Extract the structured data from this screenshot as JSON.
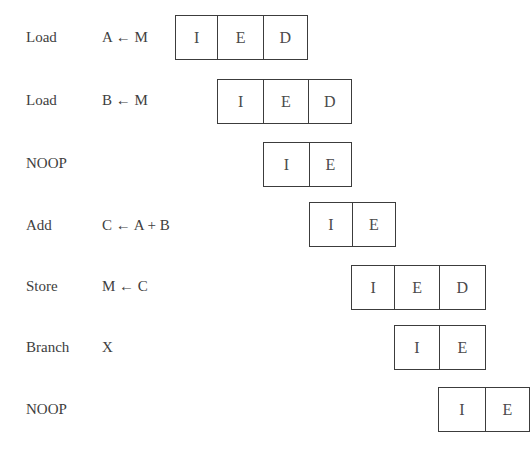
{
  "diagram": {
    "type": "pipeline-timing",
    "rows": [
      {
        "op": "Load",
        "arg": "A ← M",
        "stages": [
          "I",
          "E",
          "D"
        ],
        "start_slot": 0
      },
      {
        "op": "Load",
        "arg": "B ← M",
        "stages": [
          "I",
          "E",
          "D"
        ],
        "start_slot": 1
      },
      {
        "op": "NOOP",
        "arg": "",
        "stages": [
          "I",
          "E"
        ],
        "start_slot": 2
      },
      {
        "op": "Add",
        "arg": "C ← A + B",
        "stages": [
          "I",
          "E"
        ],
        "start_slot": 3
      },
      {
        "op": "Store",
        "arg": "M ← C",
        "stages": [
          "I",
          "E",
          "D"
        ],
        "start_slot": 4
      },
      {
        "op": "Branch",
        "arg": "X",
        "stages": [
          "I",
          "E"
        ],
        "start_slot": 5
      },
      {
        "op": "NOOP",
        "arg": "",
        "stages": [
          "I",
          "E"
        ],
        "start_slot": 6
      }
    ],
    "colors": {
      "line": "#3c3c3c",
      "text": "#404040",
      "background": "#ffffff"
    }
  }
}
